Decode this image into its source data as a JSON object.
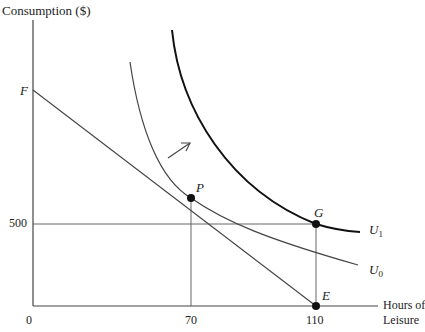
{
  "diagram": {
    "type": "labor-leisure indifference curve diagram",
    "y_axis": {
      "label": "Consumption ($)"
    },
    "x_axis": {
      "label_line1": "Hours of",
      "label_line2": "Leisure"
    },
    "ticks": {
      "x": [
        {
          "label": "0",
          "value": 0
        },
        {
          "label": "70",
          "value": 70
        },
        {
          "label": "110",
          "value": 110
        }
      ],
      "y": [
        {
          "label": "500",
          "value": 500
        }
      ]
    },
    "points": {
      "F": {
        "label": "F",
        "description": "budget line intercept on consumption axis"
      },
      "P": {
        "label": "P",
        "leisure": 70,
        "description": "tangency of budget line FE with U0"
      },
      "G": {
        "label": "G",
        "leisure": 110,
        "consumption": 500
      },
      "E": {
        "label": "E",
        "leisure": 110,
        "consumption": 0
      }
    },
    "curves": {
      "U0": {
        "label": "U",
        "subscript": "0",
        "weight": "thin"
      },
      "U1": {
        "label": "U",
        "subscript": "1",
        "weight": "thick"
      }
    },
    "lines": [
      {
        "name": "budget line",
        "from": "F",
        "to": "E"
      },
      {
        "name": "horizontal at 500",
        "from_value": 500,
        "to": "G"
      },
      {
        "name": "vertical at 70",
        "to": "P"
      },
      {
        "name": "vertical at 110",
        "from": "E",
        "to": "G"
      }
    ],
    "annotations": {
      "arrow": "shift from U0 to U1 (northeast)"
    }
  }
}
